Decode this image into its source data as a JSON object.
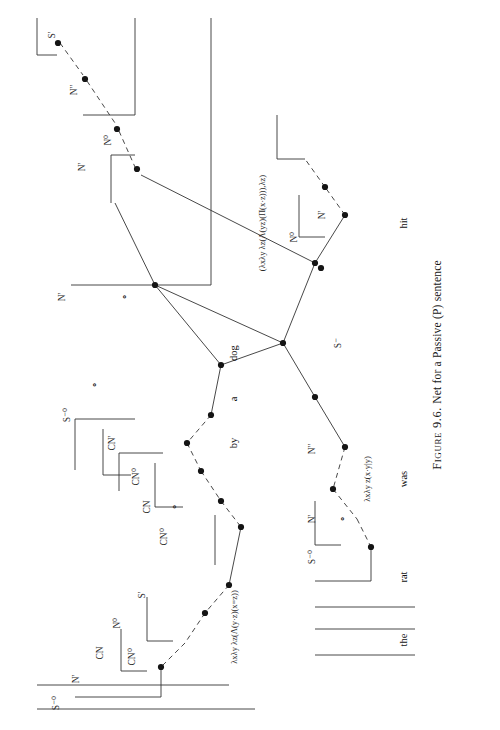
{
  "figure": {
    "caption_label": "Figure 9.6.",
    "caption_text": "Net for a Passive (P) sentence",
    "rotation_degrees": -90,
    "ink_color": "#1a1a1a",
    "background_color": "#ffffff"
  },
  "sentence": {
    "words": [
      "the",
      "rat",
      "was",
      "hit",
      "by",
      "a",
      "dog"
    ]
  },
  "word_labels": [
    {
      "id": "w-the",
      "text": "the",
      "x": 75,
      "y": 392
    },
    {
      "id": "w-rat",
      "text": "rat",
      "x": 138,
      "y": 392
    },
    {
      "id": "w-was",
      "text": "was",
      "x": 236,
      "y": 392
    },
    {
      "id": "w-hit",
      "text": "hit",
      "x": 492,
      "y": 392
    },
    {
      "id": "w-by",
      "text": "by",
      "x": 272,
      "y": 222
    },
    {
      "id": "w-a",
      "text": "a",
      "x": 316,
      "y": 222
    },
    {
      "id": "w-dog",
      "text": "dog",
      "x": 362,
      "y": 222
    }
  ],
  "lambda_terms": [
    {
      "id": "t-the",
      "text": "λxλy λz(Λ(y·z)(x=z))",
      "x": 88,
      "y": 222
    },
    {
      "id": "t-was",
      "text": "λxλy z(x·y|y)",
      "x": 236,
      "y": 355
    },
    {
      "id": "t-hit",
      "text": "(λxλy λz(Λ(yz)(Π(x·z))),λz)",
      "x": 492,
      "y": 250
    }
  ],
  "node_labels": [
    {
      "id": "n-01",
      "text": "S'",
      "x": 680,
      "y": 40
    },
    {
      "id": "n-02",
      "text": "N''",
      "x": 625,
      "y": 62
    },
    {
      "id": "n-03",
      "text": "N⁰",
      "x": 575,
      "y": 96
    },
    {
      "id": "n-04",
      "text": "N'",
      "x": 548,
      "y": 70
    },
    {
      "id": "n-05",
      "text": "N'",
      "x": 418,
      "y": 50
    },
    {
      "id": "n-06",
      "text": "∘",
      "x": 418,
      "y": 112
    },
    {
      "id": "n-07",
      "text": "∘",
      "x": 330,
      "y": 82
    },
    {
      "id": "n-08",
      "text": "S⁻⁰",
      "x": 300,
      "y": 55
    },
    {
      "id": "n-09",
      "text": "CN'",
      "x": 272,
      "y": 100
    },
    {
      "id": "n-10",
      "text": "CN⁰",
      "x": 238,
      "y": 124
    },
    {
      "id": "n-11",
      "text": "CN",
      "x": 208,
      "y": 135
    },
    {
      "id": "n-12",
      "text": "∘",
      "x": 208,
      "y": 162
    },
    {
      "id": "n-13",
      "text": "CN⁰",
      "x": 178,
      "y": 152
    },
    {
      "id": "n-14",
      "text": "S'",
      "x": 120,
      "y": 130
    },
    {
      "id": "n-15",
      "text": "N⁰",
      "x": 92,
      "y": 105
    },
    {
      "id": "n-16",
      "text": "CN",
      "x": 62,
      "y": 88
    },
    {
      "id": "n-17",
      "text": "CN⁰",
      "x": 58,
      "y": 120
    },
    {
      "id": "n-18",
      "text": "N'",
      "x": 36,
      "y": 64
    },
    {
      "id": "n-19",
      "text": "S⁻⁰",
      "x": 12,
      "y": 44
    },
    {
      "id": "n-20",
      "text": "N'",
      "x": 500,
      "y": 310
    },
    {
      "id": "n-21",
      "text": "N⁰",
      "x": 478,
      "y": 282
    },
    {
      "id": "n-22",
      "text": "S⁻",
      "x": 372,
      "y": 326
    },
    {
      "id": "n-23",
      "text": "N''",
      "x": 266,
      "y": 300
    },
    {
      "id": "n-24",
      "text": "N'",
      "x": 196,
      "y": 300
    },
    {
      "id": "n-25",
      "text": "∘",
      "x": 196,
      "y": 330
    },
    {
      "id": "n-26",
      "text": "S⁻⁰",
      "x": 158,
      "y": 300
    }
  ],
  "accessibility": {
    "description": "Categorial-grammar proof net drawn sideways on the page, showing the passive sentence the rat was hit by a dog, with node labels S', N'', N0, N', CN, CN0, S-0 and lambda-term annotations under the terminal words."
  }
}
